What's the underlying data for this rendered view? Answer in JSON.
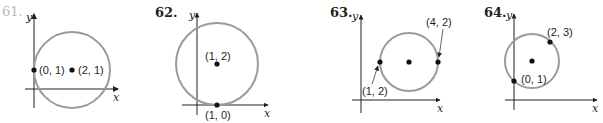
{
  "colors": {
    "circle": "#9b9b9b",
    "axis": "#231f20",
    "point": "#111111",
    "faded_label": "#b8b8b8",
    "background": "#ffffff"
  },
  "problems": [
    {
      "number": "61.",
      "number_faded": true,
      "x_label": "x",
      "y_label": "y",
      "points": [
        {
          "label": "(0, 1)",
          "role": "point on circle"
        },
        {
          "label": "(2, 1)",
          "role": "center"
        }
      ]
    },
    {
      "number": "62.",
      "x_label": "x",
      "y_label": "y",
      "points": [
        {
          "label": "(1, 2)",
          "role": "center"
        },
        {
          "label": "(1, 0)",
          "role": "point on circle"
        }
      ]
    },
    {
      "number": "63.",
      "x_label": "x",
      "y_label": "y",
      "points": [
        {
          "label": "(1, 2)",
          "role": "endpoint of diameter"
        },
        {
          "label": "(4, 2)",
          "role": "endpoint of diameter"
        },
        {
          "label": "",
          "role": "center"
        }
      ]
    },
    {
      "number": "64.",
      "x_label": "x",
      "y_label": "y",
      "points": [
        {
          "label": "(2, 3)",
          "role": "endpoint of diameter"
        },
        {
          "label": "(0, 1)",
          "role": "endpoint of diameter"
        },
        {
          "label": "",
          "role": "center"
        }
      ]
    }
  ]
}
